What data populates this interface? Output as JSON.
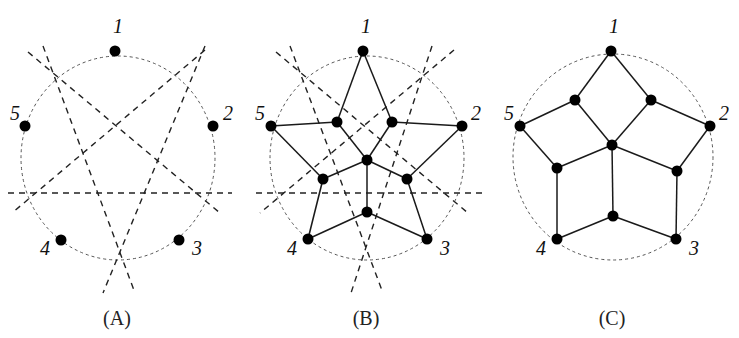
{
  "figure": {
    "colors": {
      "ink": "#000000",
      "guide": "#555555",
      "background": "#ffffff"
    },
    "panels": [
      {
        "id": "A",
        "caption": "(A)",
        "caption_pos": [
          117,
          325
        ],
        "circle": {
          "cx": 118,
          "cy": 158,
          "rx": 97,
          "ry": 102
        },
        "outer_nodes": [
          {
            "label": "1",
            "x": 115,
            "y": 51,
            "lx": 113,
            "ly": 33
          },
          {
            "label": "2",
            "x": 213,
            "y": 126,
            "lx": 223,
            "ly": 120
          },
          {
            "label": "3",
            "x": 179,
            "y": 240,
            "lx": 192,
            "ly": 255
          },
          {
            "label": "4",
            "x": 61,
            "y": 240,
            "lx": 40,
            "ly": 255
          },
          {
            "label": "5",
            "x": 25,
            "y": 126,
            "lx": 10,
            "ly": 120
          }
        ],
        "cut_lines": [
          [
            28,
            52,
            220,
            213
          ],
          [
            43,
            46,
            135,
            293
          ],
          [
            205,
            46,
            103,
            293
          ],
          [
            205,
            50,
            12,
            213
          ],
          [
            8,
            193,
            232,
            193
          ]
        ],
        "inner_nodes": [],
        "edges": []
      },
      {
        "id": "B",
        "caption": "(B)",
        "caption_pos": [
          366,
          325
        ],
        "circle": {
          "cx": 367,
          "cy": 158,
          "rx": 97,
          "ry": 102
        },
        "outer_nodes": [
          {
            "label": "1",
            "x": 363,
            "y": 51,
            "lx": 361,
            "ly": 33
          },
          {
            "label": "2",
            "x": 462,
            "y": 126,
            "lx": 471,
            "ly": 120
          },
          {
            "label": "3",
            "x": 427,
            "y": 239,
            "lx": 440,
            "ly": 255
          },
          {
            "label": "4",
            "x": 308,
            "y": 239,
            "lx": 287,
            "ly": 255
          },
          {
            "label": "5",
            "x": 271,
            "y": 126,
            "lx": 255,
            "ly": 120
          }
        ],
        "cut_lines": [
          [
            276,
            52,
            468,
            213
          ],
          [
            290,
            46,
            383,
            293
          ],
          [
            432,
            46,
            351,
            293
          ],
          [
            454,
            50,
            260,
            213
          ],
          [
            256,
            193,
            482,
            193
          ]
        ],
        "inner_nodes": [
          {
            "id": "a",
            "x": 337,
            "y": 122
          },
          {
            "id": "b",
            "x": 392,
            "y": 122
          },
          {
            "id": "o",
            "x": 367,
            "y": 160
          },
          {
            "id": "c",
            "x": 323,
            "y": 179
          },
          {
            "id": "d",
            "x": 407,
            "y": 179
          },
          {
            "id": "e",
            "x": 367,
            "y": 212
          }
        ],
        "edges": [
          [
            363,
            51,
            337,
            122
          ],
          [
            363,
            51,
            392,
            122
          ],
          [
            271,
            126,
            337,
            122
          ],
          [
            462,
            126,
            392,
            122
          ],
          [
            337,
            122,
            367,
            160
          ],
          [
            392,
            122,
            367,
            160
          ],
          [
            271,
            126,
            323,
            179
          ],
          [
            462,
            126,
            407,
            179
          ],
          [
            323,
            179,
            367,
            160
          ],
          [
            407,
            179,
            367,
            160
          ],
          [
            367,
            160,
            367,
            212
          ],
          [
            323,
            179,
            308,
            239
          ],
          [
            407,
            179,
            427,
            239
          ],
          [
            308,
            239,
            367,
            212
          ],
          [
            427,
            239,
            367,
            212
          ]
        ]
      },
      {
        "id": "C",
        "caption": "(C)",
        "caption_pos": [
          612,
          325
        ],
        "circle": {
          "cx": 613,
          "cy": 157,
          "rx": 100,
          "ry": 103
        },
        "outer_nodes": [
          {
            "label": "1",
            "x": 611,
            "y": 51,
            "lx": 609,
            "ly": 33
          },
          {
            "label": "2",
            "x": 710,
            "y": 126,
            "lx": 719,
            "ly": 120
          },
          {
            "label": "3",
            "x": 676,
            "y": 239,
            "lx": 689,
            "ly": 255
          },
          {
            "label": "4",
            "x": 557,
            "y": 239,
            "lx": 536,
            "ly": 255
          },
          {
            "label": "5",
            "x": 520,
            "y": 126,
            "lx": 504,
            "ly": 120
          }
        ],
        "cut_lines": [],
        "inner_nodes": [
          {
            "id": "a",
            "x": 575,
            "y": 100
          },
          {
            "id": "b",
            "x": 651,
            "y": 100
          },
          {
            "id": "o",
            "x": 612,
            "y": 145
          },
          {
            "id": "c",
            "x": 557,
            "y": 168
          },
          {
            "id": "d",
            "x": 677,
            "y": 171
          },
          {
            "id": "e",
            "x": 613,
            "y": 216
          }
        ],
        "edges": [
          [
            611,
            51,
            575,
            100
          ],
          [
            611,
            51,
            651,
            100
          ],
          [
            520,
            126,
            575,
            100
          ],
          [
            710,
            126,
            651,
            100
          ],
          [
            575,
            100,
            612,
            145
          ],
          [
            651,
            100,
            612,
            145
          ],
          [
            520,
            126,
            557,
            168
          ],
          [
            710,
            126,
            677,
            171
          ],
          [
            557,
            168,
            612,
            145
          ],
          [
            677,
            171,
            612,
            145
          ],
          [
            612,
            145,
            613,
            216
          ],
          [
            557,
            168,
            557,
            239
          ],
          [
            677,
            171,
            676,
            239
          ],
          [
            557,
            239,
            613,
            216
          ],
          [
            676,
            239,
            613,
            216
          ]
        ]
      }
    ]
  }
}
